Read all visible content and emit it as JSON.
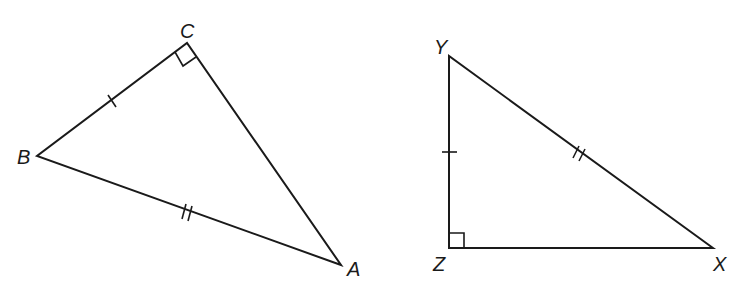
{
  "figure": {
    "triangles": [
      {
        "name": "triangle-ABC",
        "vertices": [
          {
            "label": "A",
            "x": 341,
            "y": 265
          },
          {
            "label": "B",
            "x": 37,
            "y": 156
          },
          {
            "label": "C",
            "x": 187,
            "y": 43
          }
        ],
        "right_angle_at": "C",
        "tick_marks": [
          {
            "segment": "BC",
            "count": 1
          },
          {
            "segment": "AB",
            "count": 2
          }
        ]
      },
      {
        "name": "triangle-XYZ",
        "vertices": [
          {
            "label": "X",
            "x": 713,
            "y": 248
          },
          {
            "label": "Y",
            "x": 449,
            "y": 56
          },
          {
            "label": "Z",
            "x": 449,
            "y": 248
          }
        ],
        "right_angle_at": "Z",
        "tick_marks": [
          {
            "segment": "YZ",
            "count": 1
          },
          {
            "segment": "XY",
            "count": 2
          }
        ]
      }
    ],
    "labels": {
      "A": "A",
      "B": "B",
      "C": "C",
      "X": "X",
      "Y": "Y",
      "Z": "Z"
    },
    "colors": {
      "stroke": "#1a1a1a",
      "background": "#ffffff"
    }
  }
}
